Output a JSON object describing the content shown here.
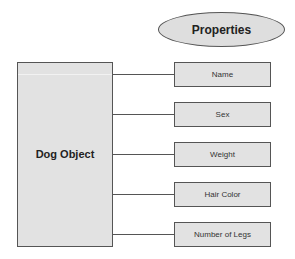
{
  "diagram": {
    "title_ellipse": {
      "label": "Properties"
    },
    "object": {
      "label": "Dog Object"
    },
    "properties": [
      {
        "label": "Name",
        "top": 62
      },
      {
        "label": "Sex",
        "top": 102
      },
      {
        "label": "Weight",
        "top": 142
      },
      {
        "label": "Hair Color",
        "top": 182
      },
      {
        "label": "Number of Legs",
        "top": 222
      }
    ],
    "colors": {
      "fill": "#e2e2e2",
      "border": "#555555",
      "text": "#222222"
    }
  }
}
